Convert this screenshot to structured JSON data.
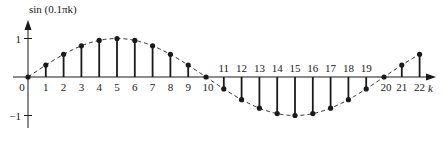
{
  "chart_data": {
    "type": "stem",
    "title": "",
    "ylabel": "sin (0.1πk)",
    "xlabel": "k",
    "xlim": [
      0,
      22
    ],
    "ylim": [
      -1,
      1
    ],
    "grid": false,
    "legend": null,
    "envelope": "dashed continuous sine curve through sample points",
    "x": [
      0,
      1,
      2,
      3,
      4,
      5,
      6,
      7,
      8,
      9,
      10,
      11,
      12,
      13,
      14,
      15,
      16,
      17,
      18,
      19,
      20,
      21,
      22
    ],
    "values": [
      0,
      0.309,
      0.588,
      0.809,
      0.951,
      1.0,
      0.951,
      0.809,
      0.588,
      0.309,
      0,
      -0.309,
      -0.588,
      -0.809,
      -0.951,
      -1.0,
      -0.951,
      -0.809,
      -0.588,
      -0.309,
      0,
      0.309,
      0.588
    ],
    "y_ticks": [
      {
        "value": 1,
        "label": "1"
      },
      {
        "value": -1,
        "label": "−1"
      }
    ],
    "x_tick_labels": [
      "0",
      "1",
      "2",
      "3",
      "4",
      "5",
      "6",
      "7",
      "8",
      "9",
      "10",
      "11",
      "12",
      "13",
      "14",
      "15",
      "16",
      "17",
      "18",
      "19",
      "20",
      "21",
      "22"
    ]
  },
  "colors": {
    "ink": "#1a1a1a",
    "background": "#ffffff"
  }
}
